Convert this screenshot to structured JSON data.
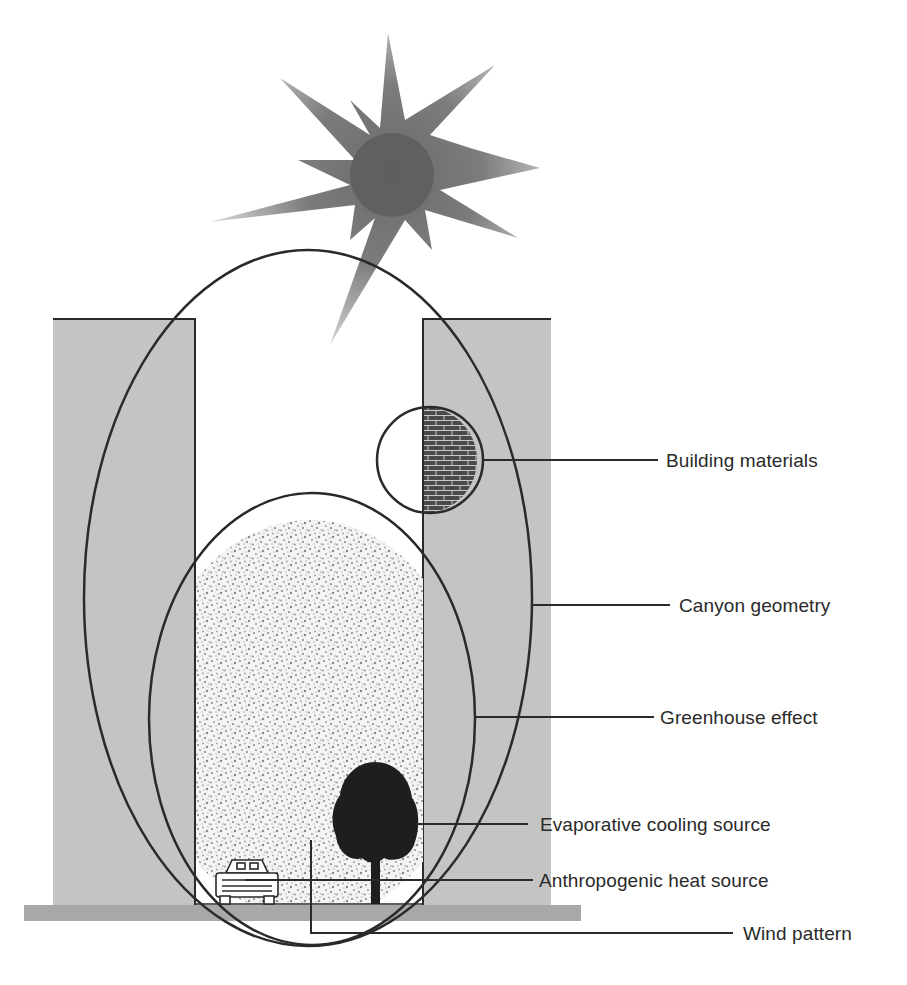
{
  "figure": {
    "type": "urban-canyon-heat-island-diagram",
    "colors": {
      "background": "#ffffff",
      "building_fill": "#c4c4c4",
      "ground_fill": "#a8a8a8",
      "outline": "#2a2a2a",
      "sun_core": "#5e5e5e",
      "sun_rays": "#7a7a7a",
      "brick_fill": "#4a4a4a",
      "tree_fill": "#1e1e1e",
      "air_speckle": "#9a9a9a"
    }
  },
  "labels": {
    "building_materials": "Building materials",
    "canyon_geometry": "Canyon geometry",
    "greenhouse_effect": "Greenhouse effect",
    "evaporative_cooling": "Evaporative cooling source",
    "anthropogenic_heat": "Anthropogenic heat source",
    "wind_pattern": "Wind pattern"
  },
  "elements": {
    "sun": {
      "icon": "sun-icon"
    },
    "left_building": {
      "icon": "building-icon"
    },
    "right_building": {
      "icon": "building-icon"
    },
    "brick_wall": {
      "icon": "brick-icon"
    },
    "tree": {
      "icon": "tree-icon"
    },
    "car": {
      "icon": "car-icon"
    },
    "ground": {
      "icon": "ground-slab"
    }
  }
}
